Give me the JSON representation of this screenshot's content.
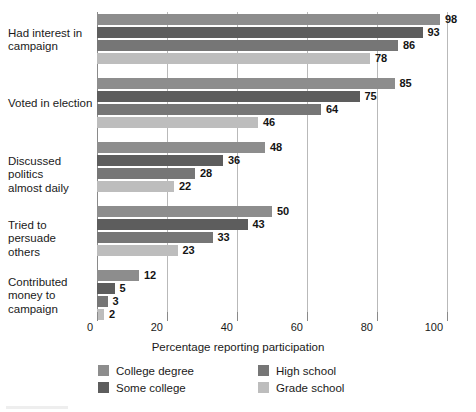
{
  "chart_data": {
    "type": "bar",
    "orientation": "horizontal",
    "title": "",
    "xlabel": "Percentage reporting participation",
    "ylabel": "",
    "xlim": [
      0,
      100
    ],
    "xticks": [
      0,
      20,
      40,
      60,
      80,
      100
    ],
    "xtick_labels": [
      "0",
      "20",
      "40",
      "60",
      "80",
      "100"
    ],
    "grid": "vertical",
    "legend_position": "bottom",
    "categories": [
      "Had interest in\ncampaign",
      "Voted in election",
      "Discussed politics\nalmost daily",
      "Tried to persuade\nothers",
      "Contributed\nmoney to\ncampaign"
    ],
    "series": [
      {
        "name": "College degree",
        "color": "#8d8d8d",
        "values": [
          98,
          85,
          48,
          50,
          12
        ]
      },
      {
        "name": "Some college",
        "color": "#5d5d5d",
        "values": [
          93,
          75,
          36,
          43,
          5
        ]
      },
      {
        "name": "High school",
        "color": "#767676",
        "values": [
          86,
          64,
          28,
          33,
          3
        ]
      },
      {
        "name": "Grade school",
        "color": "#bdbdbd",
        "values": [
          78,
          46,
          22,
          23,
          2
        ]
      }
    ],
    "data_labels": [
      [
        "98",
        "93",
        "86",
        "78"
      ],
      [
        "85",
        "75",
        "64",
        "46"
      ],
      [
        "48",
        "36",
        "28",
        "22"
      ],
      [
        "50",
        "43",
        "33",
        "23"
      ],
      [
        "12",
        "5",
        "3",
        "2"
      ]
    ]
  },
  "axis": {
    "x_title": "Percentage reporting participation",
    "ticks": [
      "0",
      "20",
      "40",
      "60",
      "80",
      "100"
    ]
  },
  "legend": {
    "items": [
      {
        "label": "College degree",
        "color": "#8d8d8d"
      },
      {
        "label": "Some college",
        "color": "#5d5d5d"
      },
      {
        "label": "High school",
        "color": "#767676"
      },
      {
        "label": "Grade school",
        "color": "#bdbdbd"
      }
    ]
  },
  "colors": {
    "gridline": "#b9b9b9",
    "axis": "#8a8a8a",
    "text": "#1a1a1a",
    "background": "#ffffff"
  }
}
